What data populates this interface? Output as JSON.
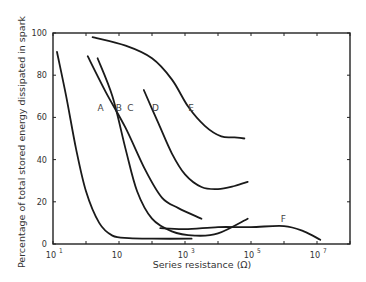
{
  "chart_data": {
    "type": "line",
    "title": "",
    "xlabel": "Series resistance (Ω)",
    "ylabel": "Percentage of total stored energy dissipated in spark",
    "xscale": "log",
    "xlim_log10": [
      -1,
      8
    ],
    "ylim": [
      0,
      100
    ],
    "grid": false,
    "legend": "inline curve labels",
    "x_ticks": [
      {
        "log10": -1,
        "base": "10",
        "exp": "-1"
      },
      {
        "log10": 1,
        "base": "10",
        "exp": ""
      },
      {
        "log10": 3,
        "base": "10",
        "exp": "3"
      },
      {
        "log10": 5,
        "base": "10",
        "exp": "5"
      },
      {
        "log10": 7,
        "base": "10",
        "exp": "7"
      }
    ],
    "x_minor_ticks_log10": [
      0,
      2,
      4,
      6,
      8
    ],
    "y_ticks": [
      0,
      20,
      40,
      60,
      80,
      100
    ],
    "series": [
      {
        "name": "A",
        "label_at": [
          0.35,
          63
        ],
        "points_log10x_y": [
          [
            -0.88,
            91
          ],
          [
            -0.6,
            70
          ],
          [
            -0.3,
            45
          ],
          [
            0.0,
            25
          ],
          [
            0.4,
            10
          ],
          [
            0.8,
            4
          ],
          [
            1.3,
            2.8
          ],
          [
            2.0,
            2.5
          ],
          [
            3.2,
            2.5
          ]
        ]
      },
      {
        "name": "B",
        "label_at": [
          0.9,
          63
        ],
        "points_log10x_y": [
          [
            0.05,
            89
          ],
          [
            0.6,
            72
          ],
          [
            1.2,
            55
          ],
          [
            1.8,
            35
          ],
          [
            2.3,
            22
          ],
          [
            2.8,
            17
          ],
          [
            3.5,
            12
          ]
        ]
      },
      {
        "name": "C",
        "label_at": [
          1.25,
          63
        ],
        "points_log10x_y": [
          [
            0.35,
            88
          ],
          [
            0.8,
            70
          ],
          [
            1.2,
            45
          ],
          [
            1.55,
            25
          ],
          [
            2.0,
            12
          ],
          [
            2.6,
            6
          ],
          [
            3.3,
            4
          ],
          [
            4.0,
            5
          ],
          [
            4.9,
            12
          ]
        ]
      },
      {
        "name": "D",
        "label_at": [
          2.0,
          63
        ],
        "points_log10x_y": [
          [
            1.75,
            73
          ],
          [
            2.2,
            57
          ],
          [
            2.6,
            43
          ],
          [
            3.0,
            33
          ],
          [
            3.5,
            27
          ],
          [
            4.0,
            26
          ],
          [
            4.5,
            27.5
          ],
          [
            4.9,
            29.5
          ]
        ]
      },
      {
        "name": "E",
        "label_at": [
          3.1,
          63
        ],
        "points_log10x_y": [
          [
            0.2,
            98
          ],
          [
            1.2,
            94
          ],
          [
            2.0,
            88
          ],
          [
            2.6,
            78
          ],
          [
            3.1,
            65
          ],
          [
            3.6,
            56
          ],
          [
            4.1,
            51
          ],
          [
            4.5,
            50.5
          ],
          [
            4.8,
            50
          ]
        ]
      },
      {
        "name": "F",
        "label_at": [
          5.9,
          10.5
        ],
        "points_log10x_y": [
          [
            2.25,
            7.5
          ],
          [
            3.0,
            7
          ],
          [
            4.0,
            8
          ],
          [
            5.0,
            8
          ],
          [
            6.0,
            8.5
          ],
          [
            6.6,
            6
          ],
          [
            7.1,
            2
          ]
        ]
      }
    ]
  }
}
